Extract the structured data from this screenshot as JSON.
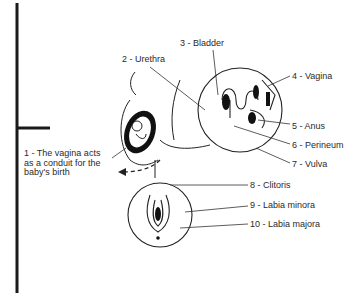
{
  "diagram": {
    "caption": {
      "line1": "1 - The vagina acts",
      "line2": "as a conduit for the",
      "line3": "baby's birth"
    },
    "labels": [
      {
        "num": 2,
        "text": "2 - Urethra"
      },
      {
        "num": 3,
        "text": "3 - Bladder"
      },
      {
        "num": 4,
        "text": "4 - Vagina"
      },
      {
        "num": 5,
        "text": "5 - Anus"
      },
      {
        "num": 6,
        "text": "6 - Perineum"
      },
      {
        "num": 7,
        "text": "7 - Vulva"
      },
      {
        "num": 8,
        "text": "8 - Clitoris"
      },
      {
        "num": 9,
        "text": "9 - Labia minora"
      },
      {
        "num": 10,
        "text": "10 - Labia majora"
      }
    ]
  }
}
